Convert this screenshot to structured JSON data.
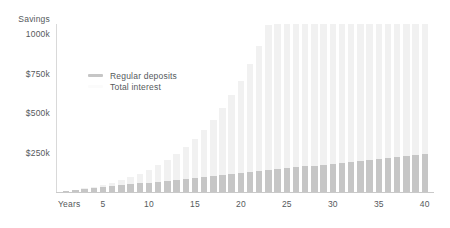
{
  "chart_data": {
    "type": "bar",
    "title": "",
    "subtitle": "",
    "stacked": true,
    "xlabel": "Years",
    "ylabel": "Savings",
    "grid": false,
    "legend_position": "inside-top-left",
    "xlim": [
      0,
      41
    ],
    "ylim": [
      0,
      1065
    ],
    "y_tick_labels": [
      "1000k",
      "$750k",
      "$500k",
      "$250k"
    ],
    "y_tick_values": [
      1000,
      750,
      500,
      250
    ],
    "x_tick_labels": [
      "5",
      "10",
      "15",
      "20",
      "25",
      "30",
      "35",
      "40"
    ],
    "x_tick_values": [
      5,
      10,
      15,
      20,
      25,
      30,
      35,
      40
    ],
    "categories": [
      1,
      2,
      3,
      4,
      5,
      6,
      7,
      8,
      9,
      10,
      11,
      12,
      13,
      14,
      15,
      16,
      17,
      18,
      19,
      20,
      21,
      22,
      23,
      24,
      25,
      26,
      27,
      28,
      29,
      30,
      31,
      32,
      33,
      34,
      35,
      36,
      37,
      38,
      39,
      40
    ],
    "series": [
      {
        "name": "Regular deposits",
        "color": "#c6c6c6",
        "values": [
          6,
          12,
          18,
          24,
          30,
          36,
          42,
          48,
          54,
          60,
          66,
          72,
          78,
          84,
          90,
          96,
          102,
          108,
          114,
          120,
          126,
          132,
          138,
          144,
          150,
          156,
          162,
          168,
          174,
          180,
          186,
          192,
          198,
          204,
          210,
          216,
          222,
          228,
          234,
          240
        ]
      },
      {
        "name": "Total interest",
        "color": "#f1f1f1",
        "values": [
          1,
          2,
          4,
          7,
          11,
          16,
          22,
          30,
          39,
          50,
          62,
          77,
          93,
          112,
          134,
          158,
          186,
          217,
          251,
          290,
          333,
          381,
          434,
          493,
          558,
          630,
          709,
          796,
          892,
          997,
          1112,
          1238,
          1376,
          1527,
          1692,
          1872,
          2069,
          2284,
          2519,
          2775
        ]
      }
    ],
    "totals": [
      7,
      15,
      24,
      34,
      46,
      60,
      76,
      95,
      117,
      142,
      171,
      205,
      243,
      287,
      336,
      393,
      457,
      530,
      612,
      705,
      809,
      927,
      1059,
      1208,
      1374,
      1560,
      1768,
      2000,
      2258,
      2546,
      2866,
      3223,
      3620,
      4062,
      4553,
      5098,
      5704,
      6376,
      7122,
      7950
    ]
  },
  "axes": {
    "y_title": "Savings",
    "x_title": "Years",
    "y_ticks": [
      {
        "label": "1000k",
        "value": 1000
      },
      {
        "label": "$750k",
        "value": 750
      },
      {
        "label": "$500k",
        "value": 500
      },
      {
        "label": "$250k",
        "value": 250
      }
    ],
    "x_ticks": [
      {
        "label": "5",
        "value": 5
      },
      {
        "label": "10",
        "value": 10
      },
      {
        "label": "15",
        "value": 15
      },
      {
        "label": "20",
        "value": 20
      },
      {
        "label": "25",
        "value": 25
      },
      {
        "label": "30",
        "value": 30
      },
      {
        "label": "35",
        "value": 35
      },
      {
        "label": "40",
        "value": 40
      }
    ]
  },
  "legend": {
    "items": [
      {
        "label": "Regular deposits",
        "color": "#c6c6c6"
      },
      {
        "label": "Total interest",
        "color": "#fbfbfb"
      }
    ]
  },
  "colors": {
    "deposits": "#c6c6c6",
    "interest": "#f1f1f1",
    "text": "#55595c",
    "axis": "#cfcfcf",
    "background": "#ffffff"
  }
}
